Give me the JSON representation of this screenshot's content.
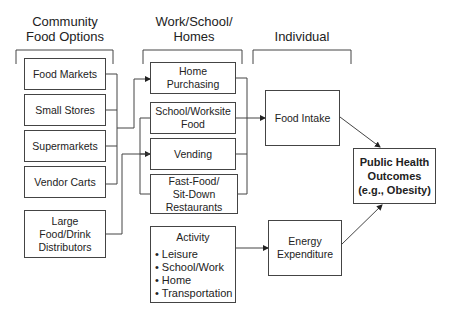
{
  "headers": {
    "community": "Community Food Options",
    "community_line1": "Community",
    "community_line2": "Food Options",
    "work_line1": "Work/School/",
    "work_line2": "Homes",
    "individual": "Individual"
  },
  "community_boxes": [
    {
      "label": "Food Markets"
    },
    {
      "label": "Small Stores"
    },
    {
      "label": "Supermarkets"
    },
    {
      "label": "Vendor Carts"
    },
    {
      "label_lines": [
        "Large",
        "Food/Drink",
        "Distributors"
      ]
    }
  ],
  "work_boxes": [
    {
      "label_lines": [
        "Home",
        "Purchasing"
      ]
    },
    {
      "label_lines": [
        "School/Worksite",
        "Food"
      ]
    },
    {
      "label": "Vending"
    },
    {
      "label_lines": [
        "Fast-Food/",
        "Sit-Down",
        "Restaurants"
      ]
    }
  ],
  "activity": {
    "title": "Activity",
    "items": [
      "Leisure",
      "School/Work",
      "Home",
      "Transportation"
    ]
  },
  "individual_boxes": {
    "food_intake": "Food Intake",
    "energy_line1": "Energy",
    "energy_line2": "Expenditure"
  },
  "outcome": {
    "line1": "Public Health",
    "line2": "Outcomes",
    "line3": "(e.g., Obesity)"
  },
  "colors": {
    "line": "#444444",
    "text": "#222222",
    "background": "#ffffff"
  }
}
